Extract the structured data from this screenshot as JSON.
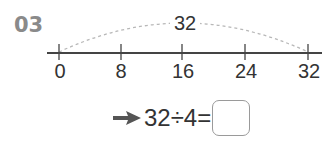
{
  "problem": {
    "number": "03"
  },
  "number_line": {
    "ticks": [
      {
        "label": "0",
        "value": 0,
        "x": 59
      },
      {
        "label": "8",
        "value": 8,
        "x": 121
      },
      {
        "label": "16",
        "value": 16,
        "x": 182
      },
      {
        "label": "24",
        "value": 24,
        "x": 245
      },
      {
        "label": "32",
        "value": 32,
        "x": 308
      }
    ],
    "arc_label": "32",
    "line_color": "#333333",
    "arc_color": "#b0b0b0"
  },
  "equation": {
    "text": "32÷4=",
    "answer": ""
  }
}
